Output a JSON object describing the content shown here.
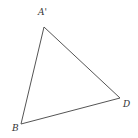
{
  "diagram": {
    "type": "triangle",
    "vertices": [
      {
        "label": "A'",
        "x": 44,
        "y": 27
      },
      {
        "label": "D",
        "x": 120,
        "y": 98
      },
      {
        "label": "B",
        "x": 21,
        "y": 124
      }
    ],
    "labels": {
      "a_prime": "A'",
      "d": "D",
      "b": "B"
    },
    "stroke_color": "#555555"
  }
}
